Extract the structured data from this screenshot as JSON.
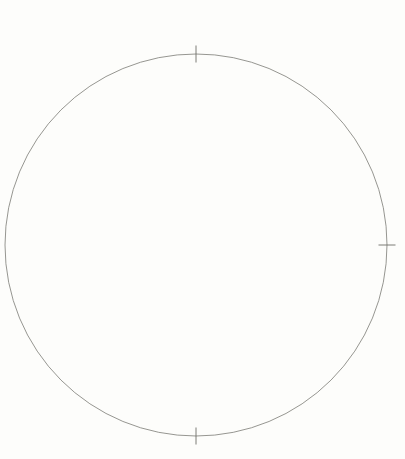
{
  "chart_data": {
    "type": "scatter",
    "xlabel": "",
    "ylabel": "",
    "xlim": [
      0,
      405
    ],
    "ylim": [
      0,
      459
    ],
    "grid": false,
    "legend": "none",
    "horizon_circle": {
      "cx": 196,
      "cy": 245,
      "r": 191,
      "label": "horizon"
    },
    "cardinal_ticks": [
      {
        "name": "top-tick",
        "x": 196,
        "y": 54,
        "orient": "vertical",
        "len": 17
      },
      {
        "name": "right-tick",
        "x": 387,
        "y": 245,
        "orient": "horizontal",
        "len": 17
      },
      {
        "name": "bottom-tick",
        "x": 196,
        "y": 436,
        "orient": "vertical",
        "len": 17
      },
      {
        "name": "center-tick",
        "x": 216,
        "y": 248,
        "orient": "cross",
        "len": 19
      }
    ],
    "named_stars": [
      {
        "name": "FOMALHAUT",
        "x": 246,
        "y": 131,
        "label_dx": 7,
        "label_dy": 3.2
      },
      {
        "name": "ACHERNAR",
        "x": 180,
        "y": 196,
        "label_dx": 7,
        "label_dy": 3.2
      },
      {
        "name": "PEACOCK",
        "x": 264,
        "y": 214,
        "label_dx": 7,
        "label_dy": 3.2
      },
      {
        "name": "CANOPUS",
        "x": 133,
        "y": 261,
        "label_dx": 7,
        "label_dy": 3.2
      },
      {
        "name": "SIRIUS",
        "x": 60,
        "y": 284,
        "label_dx": 7,
        "label_dy": 3.2
      },
      {
        "name": "RIGEL",
        "x": 49,
        "y": 212,
        "label_dx": 7,
        "label_dy": 3.2
      },
      {
        "name": "SPICA",
        "x": 270,
        "y": 396,
        "label_dx": 7,
        "label_dy": 3.2
      },
      {
        "name": "ANTARES",
        "x": 325,
        "y": 303,
        "label_dx": 6,
        "label_dy": 3.2
      }
    ],
    "constellations": [
      {
        "name": "PEGASUS",
        "label": {
          "x": 196,
          "y": 66,
          "rotate": -4,
          "style": "italic-bold"
        },
        "stars": [
          {
            "x": 228,
            "y": 20
          },
          {
            "x": 257,
            "y": 31
          },
          {
            "x": 218,
            "y": 44
          },
          {
            "x": 250,
            "y": 57
          }
        ],
        "lines": [
          [
            0,
            1
          ],
          [
            1,
            3
          ],
          [
            3,
            2
          ],
          [
            2,
            0
          ]
        ]
      },
      {
        "name": "ORION",
        "label": {
          "text": "BETELGEUSE",
          "x": 30,
          "y": 296,
          "rotate": 62,
          "style": "plain"
        },
        "stars": [
          {
            "x": 37,
            "y": 201
          },
          {
            "x": 44,
            "y": 205
          },
          {
            "x": 16,
            "y": 221
          },
          {
            "x": 52,
            "y": 234
          },
          {
            "x": 40,
            "y": 244
          },
          {
            "x": 37,
            "y": 224
          },
          {
            "x": 39,
            "y": 230
          },
          {
            "x": 41,
            "y": 232
          }
        ],
        "lines": [
          [
            0,
            5
          ],
          [
            1,
            5
          ],
          [
            2,
            5
          ],
          [
            5,
            6
          ],
          [
            6,
            7
          ],
          [
            7,
            3
          ],
          [
            7,
            4
          ]
        ],
        "hub": {
          "x": 39,
          "y": 228
        },
        "rays": [
          [
            23,
            191
          ],
          [
            33,
            176
          ],
          [
            12,
            252
          ],
          [
            64,
            262
          ]
        ]
      },
      {
        "name": "FALSE CROSS",
        "label": {
          "x": 128,
          "y": 310,
          "rotate": 0,
          "style": "italic-bold",
          "lines": [
            "FALSE",
            "CROSS"
          ]
        },
        "stars": [
          {
            "x": 160,
            "y": 291
          },
          {
            "x": 176,
            "y": 300
          },
          {
            "x": 160,
            "y": 313
          },
          {
            "x": 149,
            "y": 302
          }
        ],
        "lines": [
          [
            0,
            2
          ],
          [
            1,
            3
          ]
        ]
      },
      {
        "name": "SOUTHERN CROSS",
        "label": {
          "x": 215,
          "y": 330,
          "rotate": 0,
          "style": "italic-bold",
          "lines": [
            "SOUTHERN",
            "CROSS"
          ]
        },
        "acrux_label": {
          "text": "ACRUX",
          "x": 198,
          "y": 309,
          "rotate": -26
        },
        "stars": [
          {
            "x": 224,
            "y": 297
          },
          {
            "x": 230,
            "y": 311
          },
          {
            "x": 218,
            "y": 308
          },
          {
            "x": 232,
            "y": 303
          }
        ],
        "lines": [
          [
            0,
            1
          ],
          [
            2,
            3
          ]
        ]
      },
      {
        "name": "TRI AUST",
        "label": {
          "x": 254,
          "y": 256,
          "rotate": -7,
          "style": "italic-bold"
        },
        "stars": [
          {
            "x": 256,
            "y": 264
          },
          {
            "x": 243,
            "y": 285
          },
          {
            "x": 268,
            "y": 285
          }
        ],
        "lines": [
          [
            0,
            1
          ],
          [
            1,
            2
          ],
          [
            2,
            0
          ]
        ]
      },
      {
        "name": "SCORPION",
        "label": {
          "x": 317,
          "y": 330,
          "rotate": -22,
          "style": "italic-bold"
        },
        "stars": [
          {
            "x": 324,
            "y": 250
          },
          {
            "x": 314,
            "y": 249
          },
          {
            "x": 306,
            "y": 254
          },
          {
            "x": 303,
            "y": 263
          },
          {
            "x": 305,
            "y": 272
          },
          {
            "x": 310,
            "y": 280
          },
          {
            "x": 316,
            "y": 289
          },
          {
            "x": 321,
            "y": 298
          },
          {
            "x": 318,
            "y": 310
          },
          {
            "x": 312,
            "y": 317
          },
          {
            "x": 320,
            "y": 321
          },
          {
            "x": 329,
            "y": 318
          }
        ],
        "lines": [
          [
            0,
            1
          ],
          [
            1,
            2
          ],
          [
            2,
            3
          ],
          [
            3,
            4
          ],
          [
            4,
            5
          ],
          [
            5,
            6
          ],
          [
            6,
            7
          ],
          [
            7,
            8
          ],
          [
            8,
            9
          ],
          [
            9,
            10
          ],
          [
            10,
            11
          ]
        ]
      }
    ],
    "pointer_arrows": [
      {
        "name": "pegasus-to-fomalhaut",
        "x1": 243,
        "y1": 62,
        "x2": 243,
        "y2": 122
      },
      {
        "name": "orion-to-achernar",
        "x1": 26,
        "y1": 234,
        "x2": 172,
        "y2": 194
      },
      {
        "name": "orion-to-sirius",
        "x1": 47,
        "y1": 245,
        "x2": 62,
        "y2": 275
      },
      {
        "name": "acrux-to-rigel-kent",
        "x1": 227,
        "y1": 306,
        "x2": 268,
        "y2": 293
      }
    ],
    "rigel_kent": {
      "label_lines": [
        "RIGEL",
        "KENT"
      ],
      "label_x": 276,
      "label_y": 295,
      "star": {
        "x": 270,
        "y": 291
      }
    },
    "colors": {
      "background": "#fdfdfb",
      "star": "#000000",
      "constellation_line": "#23221c",
      "horizon": "#8a8a84",
      "pointer": "#6b6b64",
      "text": "#15140f"
    }
  }
}
